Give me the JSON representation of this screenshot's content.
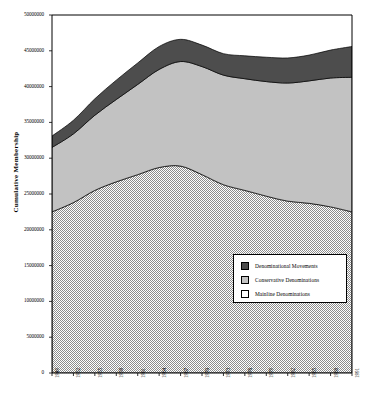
{
  "chart_data": {
    "type": "area",
    "title": "",
    "xlabel": "",
    "ylabel": "Cumulative Membership",
    "stacked": true,
    "grid": false,
    "legend_position": "lower-right",
    "xlim": [
      1949,
      1991
    ],
    "ylim": [
      0,
      50000000
    ],
    "y_ticks": [
      0,
      5000000,
      10000000,
      15000000,
      20000000,
      25000000,
      30000000,
      35000000,
      40000000,
      45000000,
      50000000
    ],
    "y_tick_labels": [
      "0",
      "5000000",
      "10000000",
      "15000000",
      "20000000",
      "25000000",
      "30000000",
      "35000000",
      "40000000",
      "45000000",
      "50000000"
    ],
    "x_ticks": [
      1949,
      1952,
      1955,
      1958,
      1961,
      1964,
      1967,
      1970,
      1973,
      1976,
      1979,
      1982,
      1985,
      1988,
      1991
    ],
    "x_tick_labels": [
      "1949",
      "1952",
      "1955",
      "1958",
      "1961",
      "1964",
      "1967",
      "1970",
      "1973",
      "1976",
      "1979",
      "1982",
      "1985",
      "1988",
      "1991"
    ],
    "x": [
      1949,
      1952,
      1955,
      1958,
      1961,
      1964,
      1967,
      1970,
      1973,
      1976,
      1979,
      1982,
      1985,
      1988,
      1991
    ],
    "series": [
      {
        "name": "Mainline Denominations",
        "color": "#ffffff",
        "pattern": "stipple",
        "values": [
          22500000,
          23800000,
          25500000,
          26700000,
          27700000,
          28700000,
          28900000,
          27700000,
          26300000,
          25500000,
          24700000,
          24000000,
          23700000,
          23200000,
          22500000
        ]
      },
      {
        "name": "Conservative Denominations",
        "color": "#c2c2c2",
        "pattern": "solid",
        "values": [
          9000000,
          9600000,
          10500000,
          11500000,
          12600000,
          13700000,
          14600000,
          15100000,
          15300000,
          15600000,
          16000000,
          16500000,
          17100000,
          18000000,
          18800000
        ]
      },
      {
        "name": "Denominational Movements",
        "color": "#4d4d4d",
        "pattern": "solid",
        "values": [
          1600000,
          1900000,
          2300000,
          2700000,
          3000000,
          3200000,
          3100000,
          3000000,
          3000000,
          3200000,
          3400000,
          3500000,
          3600000,
          3900000,
          4300000
        ]
      }
    ],
    "cumulative": {
      "mainline": [
        22500000,
        23800000,
        25500000,
        26700000,
        27700000,
        28700000,
        28900000,
        27700000,
        26300000,
        25500000,
        24700000,
        24000000,
        23700000,
        23200000,
        22500000
      ],
      "mainline_plus_conservative": [
        31500000,
        33400000,
        36000000,
        38200000,
        40300000,
        42400000,
        43500000,
        42800000,
        41600000,
        41100000,
        40700000,
        40500000,
        40800000,
        41200000,
        41300000
      ],
      "total": [
        33100000,
        35300000,
        38300000,
        40900000,
        43300000,
        45600000,
        46600000,
        45800000,
        44600000,
        44300000,
        44100000,
        44000000,
        44400000,
        45100000,
        45600000
      ]
    }
  },
  "legend": {
    "items": [
      {
        "label": "Denominational Movements",
        "swatch": "dark"
      },
      {
        "label": "Conservative Denominations",
        "swatch": "mid"
      },
      {
        "label": "Mainline Denominations",
        "swatch": "dot"
      }
    ]
  },
  "axes": {
    "y_title": "Cumulative Membership"
  }
}
